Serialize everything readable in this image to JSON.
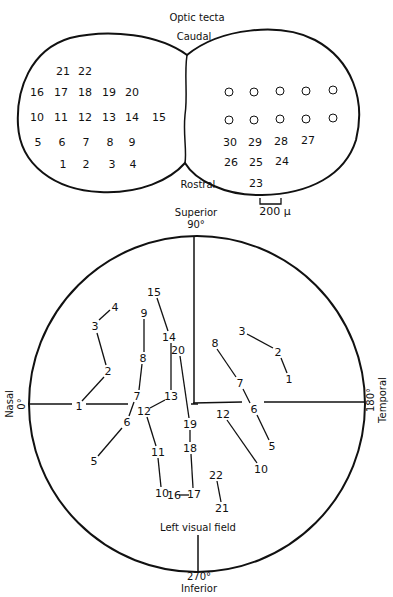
{
  "tecta": {
    "title": "Optic tecta",
    "caudal": "Caudal",
    "rostral": "Rostral",
    "scale_bar": "200 μ",
    "left_points": [
      {
        "n": "21",
        "x": 63,
        "y": 71
      },
      {
        "n": "22",
        "x": 85,
        "y": 71
      },
      {
        "n": "16",
        "x": 37,
        "y": 92
      },
      {
        "n": "17",
        "x": 61,
        "y": 92
      },
      {
        "n": "18",
        "x": 85,
        "y": 92
      },
      {
        "n": "19",
        "x": 109,
        "y": 92
      },
      {
        "n": "20",
        "x": 132,
        "y": 92
      },
      {
        "n": "10",
        "x": 37,
        "y": 117
      },
      {
        "n": "11",
        "x": 61,
        "y": 117
      },
      {
        "n": "12",
        "x": 85,
        "y": 117
      },
      {
        "n": "13",
        "x": 109,
        "y": 117
      },
      {
        "n": "14",
        "x": 132,
        "y": 117
      },
      {
        "n": "15",
        "x": 159,
        "y": 117
      },
      {
        "n": "5",
        "x": 38,
        "y": 142
      },
      {
        "n": "6",
        "x": 62,
        "y": 142
      },
      {
        "n": "7",
        "x": 86,
        "y": 142
      },
      {
        "n": "8",
        "x": 110,
        "y": 142
      },
      {
        "n": "9",
        "x": 132,
        "y": 142
      },
      {
        "n": "1",
        "x": 63,
        "y": 164
      },
      {
        "n": "2",
        "x": 86,
        "y": 164
      },
      {
        "n": "3",
        "x": 112,
        "y": 164
      },
      {
        "n": "4",
        "x": 133,
        "y": 164
      }
    ],
    "right_circles": [
      {
        "x": 229,
        "y": 92
      },
      {
        "x": 254,
        "y": 92
      },
      {
        "x": 280,
        "y": 91
      },
      {
        "x": 306,
        "y": 91
      },
      {
        "x": 333,
        "y": 90
      },
      {
        "x": 229,
        "y": 120
      },
      {
        "x": 254,
        "y": 120
      },
      {
        "x": 280,
        "y": 119
      },
      {
        "x": 306,
        "y": 119
      },
      {
        "x": 333,
        "y": 118
      }
    ],
    "right_points": [
      {
        "n": "30",
        "x": 230,
        "y": 142
      },
      {
        "n": "29",
        "x": 255,
        "y": 142
      },
      {
        "n": "28",
        "x": 281,
        "y": 141
      },
      {
        "n": "27",
        "x": 308,
        "y": 140
      },
      {
        "n": "26",
        "x": 231,
        "y": 162
      },
      {
        "n": "25",
        "x": 256,
        "y": 162
      },
      {
        "n": "24",
        "x": 282,
        "y": 161
      },
      {
        "n": "23",
        "x": 256,
        "y": 183
      }
    ]
  },
  "field": {
    "superior": "Superior",
    "superior_deg": "90°",
    "inferior": "Inferior",
    "inferior_deg": "270°",
    "nasal": "Nasal",
    "nasal_deg": "0°",
    "temporal": "Temporal",
    "temporal_deg": "180°",
    "caption": "Left visual field",
    "left_eye_labels": [
      {
        "n": "1",
        "x": 79,
        "y": 406
      },
      {
        "n": "2",
        "x": 108,
        "y": 371
      },
      {
        "n": "3",
        "x": 95,
        "y": 326
      },
      {
        "n": "4",
        "x": 115,
        "y": 307
      },
      {
        "n": "5",
        "x": 94,
        "y": 461
      },
      {
        "n": "6",
        "x": 127,
        "y": 422
      },
      {
        "n": "7",
        "x": 137,
        "y": 396
      },
      {
        "n": "8",
        "x": 143,
        "y": 358
      },
      {
        "n": "9",
        "x": 144,
        "y": 313
      },
      {
        "n": "10",
        "x": 162,
        "y": 493
      },
      {
        "n": "11",
        "x": 158,
        "y": 452
      },
      {
        "n": "12",
        "x": 144,
        "y": 411
      },
      {
        "n": "13",
        "x": 171,
        "y": 396
      },
      {
        "n": "14",
        "x": 169,
        "y": 337
      },
      {
        "n": "15",
        "x": 154,
        "y": 292
      },
      {
        "n": "16",
        "x": 174,
        "y": 495
      },
      {
        "n": "17",
        "x": 194,
        "y": 494
      },
      {
        "n": "18",
        "x": 190,
        "y": 448
      },
      {
        "n": "19",
        "x": 190,
        "y": 424
      },
      {
        "n": "20",
        "x": 178,
        "y": 350
      },
      {
        "n": "21",
        "x": 222,
        "y": 508
      },
      {
        "n": "22",
        "x": 216,
        "y": 475
      }
    ],
    "right_eye_labels": [
      {
        "n": "1",
        "x": 289,
        "y": 379
      },
      {
        "n": "2",
        "x": 278,
        "y": 352
      },
      {
        "n": "3",
        "x": 242,
        "y": 331
      },
      {
        "n": "8",
        "x": 215,
        "y": 343
      },
      {
        "n": "7",
        "x": 240,
        "y": 383
      },
      {
        "n": "6",
        "x": 254,
        "y": 409
      },
      {
        "n": "5",
        "x": 272,
        "y": 446
      },
      {
        "n": "12",
        "x": 223,
        "y": 414
      },
      {
        "n": "10",
        "x": 261,
        "y": 469
      }
    ]
  }
}
